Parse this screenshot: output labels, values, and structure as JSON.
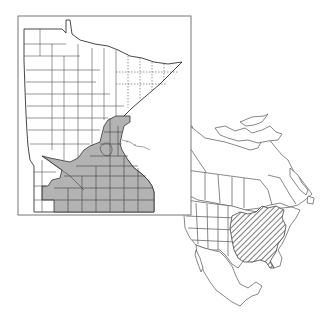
{
  "figure": {
    "type": "species range map",
    "panels": [
      {
        "id": "minnesota",
        "description": "Minnesota county outline map with occupied counties shaded gray",
        "frame": {
          "x": 18,
          "y": 16,
          "width": 173,
          "height": 199
        },
        "shaded_region": "southern and east-central Minnesota counties",
        "colors": {
          "shade": "#b3b3b3",
          "line": "#444444",
          "frame": "#777777"
        }
      },
      {
        "id": "north-america",
        "description": "North America outline with state/province boundaries; range shown with diagonal hatching",
        "hatched_region": "eastern United States",
        "colors": {
          "line": "#555555",
          "hatch": "#444444"
        }
      }
    ]
  }
}
